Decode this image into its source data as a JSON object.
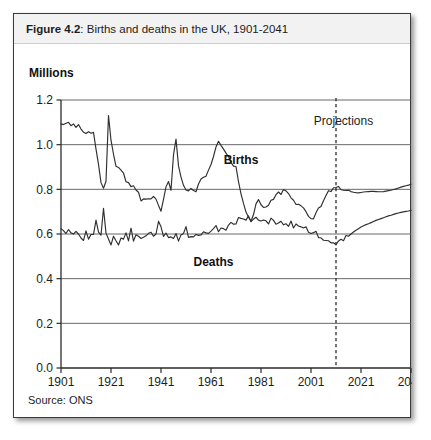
{
  "figure": {
    "number_label": "Figure 4.2",
    "title_separator": ": ",
    "title_rest": "Births and deaths in the UK, 1901-2041",
    "source": "Source: ONS",
    "unit_label": "Millions"
  },
  "chart_data": {
    "type": "line",
    "title": "Figure 4.2: Births and deaths in the UK, 1901-2041",
    "xlabel": "",
    "ylabel": "Millions",
    "xlim": [
      1901,
      2041
    ],
    "ylim": [
      0.0,
      1.2
    ],
    "grid": true,
    "legend": "inline-annotations",
    "ytick_labels": [
      "0.0",
      "0.2",
      "0.4",
      "0.6",
      "0.8",
      "1.0",
      "1.2"
    ],
    "ytick_values": [
      0.0,
      0.2,
      0.4,
      0.6,
      0.8,
      1.0,
      1.2
    ],
    "xtick_labels": [
      "1901",
      "1921",
      "1941",
      "1961",
      "1981",
      "2001",
      "2021",
      "2041"
    ],
    "xtick_values": [
      1901,
      1921,
      1941,
      1961,
      1981,
      2001,
      2021,
      2041
    ],
    "annotations": [
      {
        "text": "Projections",
        "x": 2014,
        "y": 1.09
      },
      {
        "text": "Births",
        "x": 1973,
        "y": 0.915
      },
      {
        "text": "Deaths",
        "x": 1962,
        "y": 0.455
      }
    ],
    "projection_divider": {
      "x": 2011,
      "label": "Projections",
      "style": "dashed"
    },
    "x": [
      1901,
      1902,
      1903,
      1904,
      1905,
      1906,
      1907,
      1908,
      1909,
      1910,
      1911,
      1912,
      1913,
      1914,
      1915,
      1916,
      1917,
      1918,
      1919,
      1920,
      1921,
      1922,
      1923,
      1924,
      1925,
      1926,
      1927,
      1928,
      1929,
      1930,
      1931,
      1932,
      1933,
      1934,
      1935,
      1936,
      1937,
      1938,
      1939,
      1940,
      1941,
      1942,
      1943,
      1944,
      1945,
      1946,
      1947,
      1948,
      1949,
      1950,
      1951,
      1952,
      1953,
      1954,
      1955,
      1956,
      1957,
      1958,
      1959,
      1960,
      1961,
      1962,
      1963,
      1964,
      1965,
      1966,
      1967,
      1968,
      1969,
      1970,
      1971,
      1972,
      1973,
      1974,
      1975,
      1976,
      1977,
      1978,
      1979,
      1980,
      1981,
      1982,
      1983,
      1984,
      1985,
      1986,
      1987,
      1988,
      1989,
      1990,
      1991,
      1992,
      1993,
      1994,
      1995,
      1996,
      1997,
      1998,
      1999,
      2000,
      2001,
      2002,
      2003,
      2004,
      2005,
      2006,
      2007,
      2008,
      2009,
      2010,
      2011,
      2012,
      2013,
      2014,
      2015,
      2016,
      2017,
      2018,
      2019,
      2020,
      2021,
      2022,
      2023,
      2024,
      2025,
      2026,
      2027,
      2028,
      2029,
      2030,
      2031,
      2032,
      2033,
      2034,
      2035,
      2036,
      2037,
      2038,
      2039,
      2040,
      2041
    ],
    "series": [
      {
        "name": "Births",
        "values": [
          1.093,
          1.09,
          1.096,
          1.1,
          1.085,
          1.093,
          1.077,
          1.09,
          1.07,
          1.056,
          1.05,
          1.058,
          1.051,
          1.055,
          0.98,
          0.912,
          0.83,
          0.805,
          0.836,
          1.13,
          1.02,
          0.957,
          0.903,
          0.898,
          0.886,
          0.873,
          0.834,
          0.83,
          0.812,
          0.816,
          0.797,
          0.787,
          0.748,
          0.757,
          0.756,
          0.758,
          0.757,
          0.768,
          0.756,
          0.728,
          0.702,
          0.755,
          0.811,
          0.835,
          0.796,
          0.955,
          1.025,
          0.905,
          0.855,
          0.818,
          0.797,
          0.793,
          0.804,
          0.795,
          0.789,
          0.824,
          0.846,
          0.854,
          0.859,
          0.886,
          0.911,
          0.947,
          0.99,
          1.015,
          0.997,
          0.98,
          0.962,
          0.947,
          0.92,
          0.904,
          0.902,
          0.834,
          0.78,
          0.737,
          0.698,
          0.675,
          0.657,
          0.687,
          0.735,
          0.754,
          0.731,
          0.719,
          0.721,
          0.729,
          0.751,
          0.755,
          0.776,
          0.788,
          0.777,
          0.799,
          0.793,
          0.781,
          0.762,
          0.751,
          0.732,
          0.733,
          0.726,
          0.717,
          0.7,
          0.679,
          0.669,
          0.668,
          0.695,
          0.716,
          0.723,
          0.749,
          0.772,
          0.794,
          0.79,
          0.807,
          0.808,
          0.813,
          0.798,
          0.796,
          0.795,
          0.796,
          0.79,
          0.787,
          0.785,
          0.784,
          0.786,
          0.788,
          0.789,
          0.79,
          0.791,
          0.791,
          0.79,
          0.789,
          0.789,
          0.79,
          0.792,
          0.794,
          0.796,
          0.799,
          0.802,
          0.806,
          0.81,
          0.813,
          0.816,
          0.819,
          0.823
        ]
      },
      {
        "name": "Deaths",
        "values": [
          0.624,
          0.615,
          0.602,
          0.62,
          0.605,
          0.6,
          0.612,
          0.6,
          0.582,
          0.571,
          0.614,
          0.577,
          0.598,
          0.598,
          0.662,
          0.608,
          0.595,
          0.715,
          0.604,
          0.578,
          0.551,
          0.59,
          0.57,
          0.551,
          0.582,
          0.577,
          0.605,
          0.569,
          0.626,
          0.568,
          0.597,
          0.59,
          0.58,
          0.585,
          0.592,
          0.603,
          0.608,
          0.59,
          0.6,
          0.657,
          0.632,
          0.589,
          0.604,
          0.584,
          0.587,
          0.58,
          0.602,
          0.568,
          0.596,
          0.602,
          0.633,
          0.585,
          0.588,
          0.587,
          0.598,
          0.594,
          0.596,
          0.61,
          0.605,
          0.603,
          0.613,
          0.624,
          0.638,
          0.61,
          0.627,
          0.624,
          0.617,
          0.64,
          0.652,
          0.644,
          0.645,
          0.674,
          0.67,
          0.667,
          0.662,
          0.681,
          0.655,
          0.667,
          0.675,
          0.662,
          0.658,
          0.663,
          0.659,
          0.645,
          0.671,
          0.661,
          0.644,
          0.649,
          0.657,
          0.641,
          0.646,
          0.634,
          0.658,
          0.627,
          0.645,
          0.636,
          0.632,
          0.627,
          0.632,
          0.608,
          0.602,
          0.606,
          0.612,
          0.584,
          0.583,
          0.572,
          0.571,
          0.57,
          0.56,
          0.561,
          0.552,
          0.569,
          0.576,
          0.57,
          0.593,
          0.59,
          0.6,
          0.609,
          0.617,
          0.624,
          0.631,
          0.637,
          0.642,
          0.646,
          0.651,
          0.656,
          0.661,
          0.665,
          0.669,
          0.673,
          0.677,
          0.681,
          0.684,
          0.688,
          0.691,
          0.694,
          0.697,
          0.699,
          0.701,
          0.703,
          0.706
        ]
      }
    ]
  }
}
